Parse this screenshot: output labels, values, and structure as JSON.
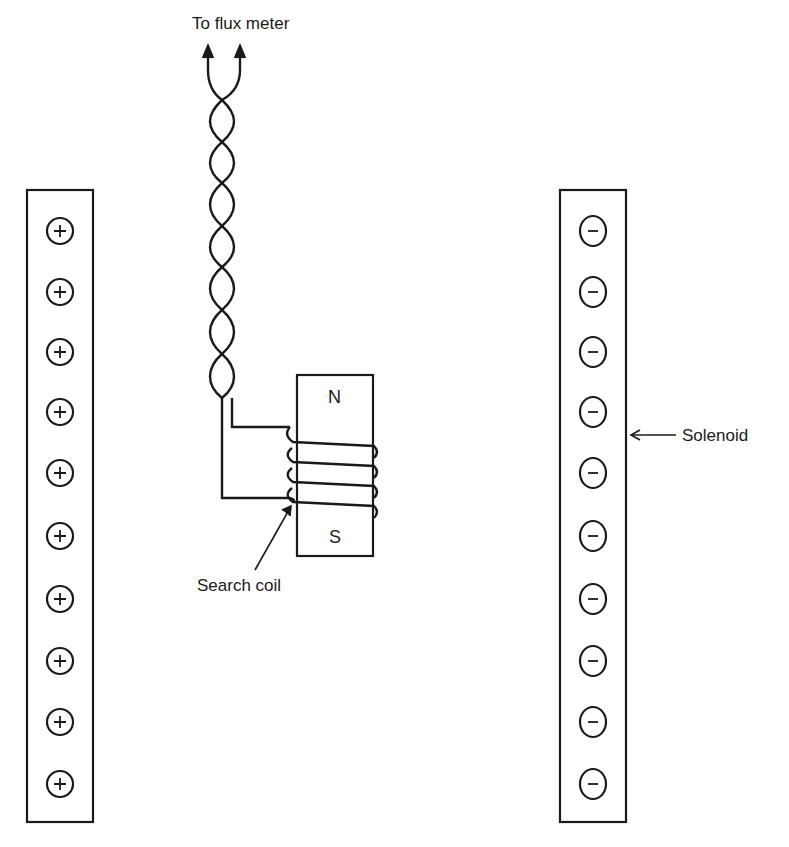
{
  "diagram": {
    "labels": {
      "flux_meter": "To flux meter",
      "solenoid": "Solenoid",
      "search_coil": "Search coil",
      "north_pole": "N",
      "south_pole": "S"
    },
    "left_winding": {
      "symbol": "+",
      "count": 10
    },
    "right_winding": {
      "symbol": "−",
      "count": 10
    },
    "search_coil_turns": 4,
    "stroke_color": "#1a1a1a"
  }
}
